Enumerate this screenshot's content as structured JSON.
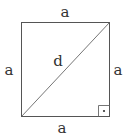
{
  "diagram": {
    "title": "",
    "shape": "square",
    "labels": {
      "top": "a",
      "left": "a",
      "right": "a",
      "bottom": "a",
      "diagonal": "d"
    },
    "right_angle_marker": {
      "corner": "bottom-right",
      "symbol": "dot"
    },
    "colors": {
      "stroke": "#555555",
      "text": "#333333",
      "background": "#ffffff"
    }
  }
}
